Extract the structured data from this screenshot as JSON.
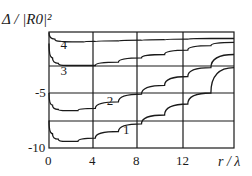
{
  "chart_data": {
    "type": "line",
    "title": "",
    "ylabel": "Δ / |R0|²",
    "xlabel": "r / λ",
    "xlim": [
      0,
      16
    ],
    "ylim": [
      -10,
      0.5
    ],
    "grid": true,
    "x_ticks": [
      "0",
      "4",
      "8",
      "12"
    ],
    "y_ticks": [
      "-5",
      "-10"
    ],
    "series": [
      {
        "name": "1",
        "x": [
          0,
          0.3,
          0.8,
          1.5,
          2.5,
          4,
          6,
          8,
          10,
          12,
          14,
          16
        ],
        "values": [
          -7.5,
          -8.7,
          -9.2,
          -9.4,
          -9.4,
          -9.1,
          -8.5,
          -7.8,
          -7.0,
          -6.0,
          -5.0,
          -2.7
        ]
      },
      {
        "name": "2",
        "x": [
          0,
          0.3,
          0.8,
          1.5,
          2.5,
          4,
          6,
          8,
          10,
          12,
          14,
          16
        ],
        "values": [
          -5.0,
          -6.1,
          -6.5,
          -6.6,
          -6.6,
          -6.4,
          -5.8,
          -5.1,
          -4.3,
          -3.5,
          -2.7,
          -1.5
        ]
      },
      {
        "name": "3",
        "x": [
          0,
          0.3,
          0.8,
          1.5,
          2.5,
          4,
          6,
          8,
          10,
          12,
          14,
          16
        ],
        "values": [
          -0.5,
          -1.8,
          -2.3,
          -2.5,
          -2.5,
          -2.5,
          -2.2,
          -1.8,
          -1.5,
          -1.1,
          -0.7,
          -0.4
        ]
      },
      {
        "name": "4",
        "x": [
          0,
          0.5,
          1,
          2,
          3,
          4,
          6,
          8,
          10,
          12,
          14,
          16
        ],
        "values": [
          0.5,
          -0.1,
          -0.3,
          -0.35,
          -0.35,
          -0.3,
          -0.25,
          -0.2,
          -0.15,
          -0.1,
          -0.05,
          -0.05
        ]
      }
    ],
    "curve_labels": [
      {
        "text": "1",
        "x": 6.4,
        "y": -8.7
      },
      {
        "text": "2",
        "x": 5.0,
        "y": -6.1
      },
      {
        "text": "3",
        "x": 1.0,
        "y": -3.4
      },
      {
        "text": "4",
        "x": 1.0,
        "y": -1.0
      }
    ]
  }
}
